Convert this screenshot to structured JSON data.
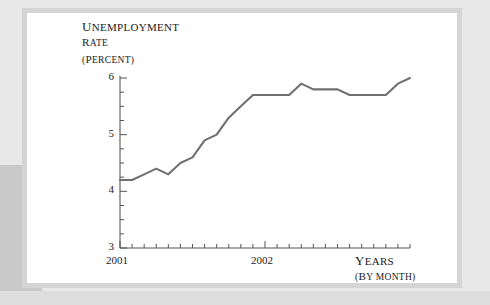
{
  "figure": {
    "background_color": "#e8e8e8",
    "card_color": "#ffffff",
    "card_border_color": "#d5d5d5",
    "line_color": "#707070",
    "axis_color": "#555555",
    "text_color": "#1a1a1a"
  },
  "labels": {
    "y_title_line1": "Unemployment",
    "y_title_line2": "rate",
    "y_title_line3": "(percent)",
    "x_title_line1": "Years",
    "x_title_line2": "(by month)"
  },
  "chart_data": {
    "type": "line",
    "title": "",
    "subtitle": "",
    "xlabel": "Years (by month)",
    "ylabel": "Unemployment rate (percent)",
    "ylim": [
      3,
      6
    ],
    "xlim": [
      "2001-01",
      "2002-12"
    ],
    "grid": false,
    "legend": false,
    "y_ticks_major": [
      "3",
      "4",
      "5",
      "6"
    ],
    "y_tick_values": [
      3,
      4,
      5,
      6
    ],
    "y_minor_tick_step": 0.25,
    "x_ticks_major": [
      "2001",
      "2002"
    ],
    "x_tick_major_values": [
      "2001-01",
      "2002-01"
    ],
    "x_minor_tick_interval": "month",
    "x_total_months": 25,
    "categories": [
      "2001-01",
      "2001-02",
      "2001-03",
      "2001-04",
      "2001-05",
      "2001-06",
      "2001-07",
      "2001-08",
      "2001-09",
      "2001-10",
      "2001-11",
      "2001-12",
      "2002-01",
      "2002-02",
      "2002-03",
      "2002-04",
      "2002-05",
      "2002-06",
      "2002-07",
      "2002-08",
      "2002-09",
      "2002-10",
      "2002-11",
      "2002-12",
      "2003-01"
    ],
    "values": [
      4.2,
      4.2,
      4.3,
      4.4,
      4.3,
      4.5,
      4.6,
      4.9,
      5.0,
      5.3,
      5.5,
      5.7,
      5.7,
      5.7,
      5.7,
      5.9,
      5.8,
      5.8,
      5.8,
      5.7,
      5.7,
      5.7,
      5.7,
      5.9,
      6.0
    ],
    "series": [
      {
        "name": "Unemployment rate",
        "color": "#707070",
        "values": [
          4.2,
          4.2,
          4.3,
          4.4,
          4.3,
          4.5,
          4.6,
          4.9,
          5.0,
          5.3,
          5.5,
          5.7,
          5.7,
          5.7,
          5.7,
          5.9,
          5.8,
          5.8,
          5.8,
          5.7,
          5.7,
          5.7,
          5.7,
          5.9,
          6.0
        ]
      }
    ]
  }
}
